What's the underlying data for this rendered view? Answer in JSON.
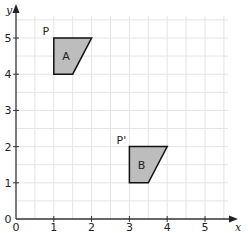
{
  "axes": {
    "x_label": "x",
    "y_label": "y",
    "x_ticks": [
      "0",
      "1",
      "2",
      "3",
      "4",
      "5"
    ],
    "y_ticks": [
      "0",
      "1",
      "2",
      "3",
      "4",
      "5"
    ],
    "grid": true,
    "grid_step": 0.5
  },
  "shapes": [
    {
      "name": "A",
      "vertex_label": "P",
      "vertices": [
        [
          1,
          4
        ],
        [
          1,
          5
        ],
        [
          2,
          5
        ],
        [
          1.5,
          4
        ]
      ],
      "fill": "#bdbdbd"
    },
    {
      "name": "B",
      "vertex_label": "P'",
      "vertices": [
        [
          3,
          1
        ],
        [
          3,
          2
        ],
        [
          4,
          2
        ],
        [
          3.5,
          1
        ]
      ],
      "fill": "#bdbdbd"
    }
  ],
  "colors": {
    "grid": "#e4e4e4",
    "axis": "#333333",
    "outline": "#111111"
  }
}
